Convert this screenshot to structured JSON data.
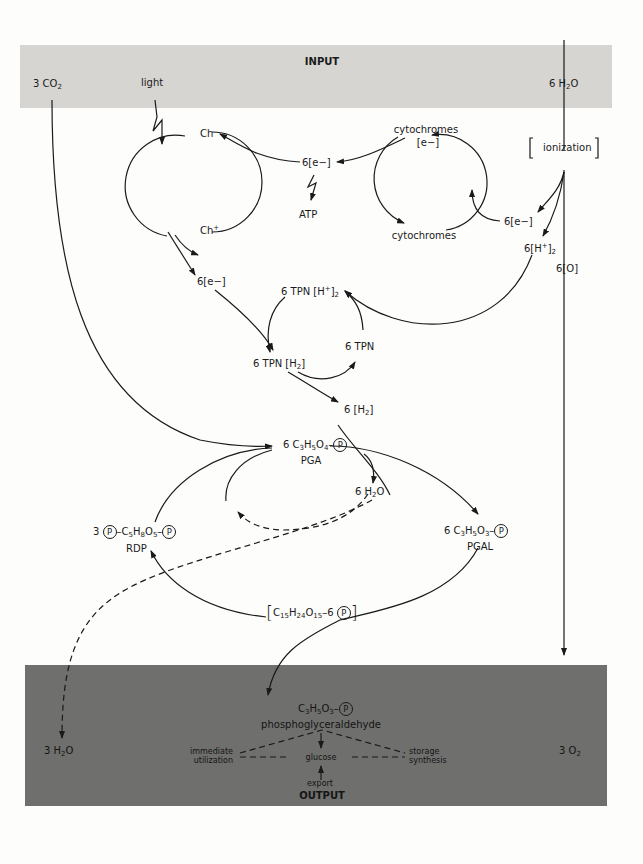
{
  "input_band": {
    "title": "INPUT",
    "co2": {
      "coef": "3 CO",
      "sub": "2"
    },
    "light": "light",
    "water": {
      "coef": "6 H",
      "sub": "2",
      "tail": "O"
    },
    "color": "#d6d5d2"
  },
  "light_reaction": {
    "ch": "Ch",
    "ch_plus": {
      "base": "Ch",
      "sup": "+"
    },
    "electrons_center": "6[e−]",
    "atp": "ATP",
    "cytochromes_top": "cytochromes",
    "cytochromes_e": "[e−]",
    "cytochromes_bottom": "cytochromes",
    "ionization": "ionization",
    "electrons_right": "6[e−]",
    "protons_right": {
      "base": "6[H",
      "sup": "+",
      "tail": "]",
      "sub": "2"
    },
    "oxygen_atoms": "6[O]",
    "electrons_left": "6[e−]"
  },
  "tpn_cycle": {
    "tpn_h_plus": {
      "base": "6  TPN [H",
      "sup": "+",
      "tail": "]",
      "sub": "2"
    },
    "tpn": "6  TPN",
    "tpn_h2": {
      "base": "6  TPN [H",
      "sub": "2",
      "tail": "]"
    },
    "hydrogen": {
      "base": "6 [H",
      "sub": "2",
      "tail": "]"
    }
  },
  "calvin_cycle": {
    "pga": {
      "formula_pre": "6 C",
      "s1": "3",
      "m1": "H",
      "s2": "5",
      "m2": "O",
      "s3": "4",
      "dash": "–",
      "p": "P",
      "name": "PGA"
    },
    "water_mid": {
      "coef": "6 H",
      "sub": "2",
      "tail": "O"
    },
    "rdp": {
      "coef": "3",
      "p": "P",
      "dash1": "–C",
      "s1": "5",
      "m1": "H",
      "s2": "8",
      "m2": "O",
      "s3": "5",
      "dash2": "–",
      "name": "RDP"
    },
    "pgal": {
      "formula_pre": "6 C",
      "s1": "3",
      "m1": "H",
      "s2": "5",
      "m2": "O",
      "s3": "3",
      "dash": "–",
      "p": "P",
      "name": "PGAL"
    },
    "hexose": {
      "pre": "C",
      "s1": "15",
      "m1": "H",
      "s2": "24",
      "m2": "O",
      "s3": "15",
      "dash": "–6",
      "p": "P"
    }
  },
  "output_band": {
    "title": "OUTPUT",
    "water": {
      "coef": "3 H",
      "sub": "2",
      "tail": "O"
    },
    "oxygen": {
      "coef": "3  O",
      "sub": "2"
    },
    "product_formula": {
      "pre": "C",
      "s1": "3",
      "m1": "H",
      "s2": "5",
      "m2": "O",
      "s3": "3",
      "dash": "–",
      "p": "P"
    },
    "product_name": "phosphoglyceraldehyde",
    "uses": {
      "immediate_1": "immediate",
      "immediate_2": "utilization",
      "glucose": "glucose",
      "storage_1": "storage",
      "storage_2": "synthesis",
      "export": "export"
    },
    "color": "#6f6f6d"
  }
}
